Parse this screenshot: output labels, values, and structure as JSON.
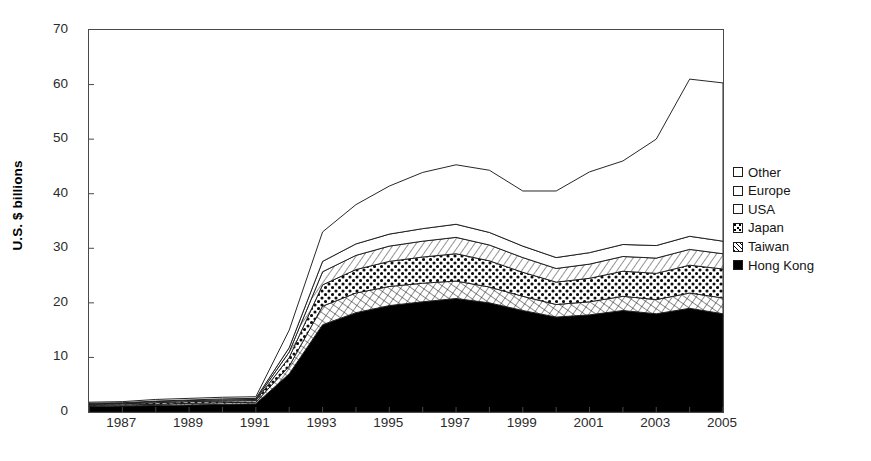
{
  "chart_data": {
    "type": "area",
    "stacked": true,
    "title": "",
    "xlabel": "",
    "ylabel": "U.S. $ billions",
    "ylim": [
      0,
      70
    ],
    "ytick_step": 10,
    "yticks": [
      70,
      60,
      50,
      40,
      30,
      20,
      10,
      0
    ],
    "xlim": [
      1986,
      2005
    ],
    "xticks": [
      1987,
      1989,
      1991,
      1993,
      1995,
      1997,
      1999,
      2001,
      2003,
      2005
    ],
    "x": [
      1986,
      1987,
      1988,
      1989,
      1990,
      1991,
      1992,
      1993,
      1994,
      1995,
      1996,
      1997,
      1998,
      1999,
      2000,
      2001,
      2002,
      2003,
      2004,
      2005
    ],
    "grid": false,
    "legend_position": "right",
    "series": [
      {
        "name": "Hong Kong",
        "fill": "solid-black",
        "values": [
          1.0,
          1.1,
          1.2,
          1.3,
          1.4,
          1.5,
          7.0,
          16.0,
          18.2,
          19.5,
          20.2,
          20.8,
          20.0,
          18.6,
          17.4,
          17.8,
          18.6,
          18.0,
          19.0,
          18.0
        ]
      },
      {
        "name": "Taiwan",
        "fill": "diagonal-crosshatch",
        "values": [
          0.2,
          0.2,
          0.2,
          0.3,
          0.3,
          0.3,
          1.4,
          3.4,
          3.6,
          3.5,
          3.4,
          3.2,
          2.9,
          2.6,
          2.3,
          2.4,
          2.6,
          2.6,
          2.8,
          2.9
        ]
      },
      {
        "name": "Japan",
        "fill": "dotted",
        "values": [
          0.2,
          0.2,
          0.3,
          0.3,
          0.3,
          0.3,
          1.6,
          3.9,
          4.3,
          4.6,
          4.8,
          5.0,
          4.8,
          4.4,
          4.1,
          4.3,
          4.6,
          4.8,
          5.1,
          5.3
        ]
      },
      {
        "name": "USA",
        "fill": "diagonal-lines",
        "values": [
          0.1,
          0.1,
          0.2,
          0.2,
          0.2,
          0.2,
          1.0,
          2.4,
          2.6,
          2.8,
          2.9,
          3.0,
          2.9,
          2.7,
          2.5,
          2.6,
          2.7,
          2.8,
          2.9,
          2.8
        ]
      },
      {
        "name": "Europe",
        "fill": "white",
        "values": [
          0.1,
          0.1,
          0.1,
          0.1,
          0.2,
          0.2,
          0.8,
          1.9,
          2.1,
          2.2,
          2.3,
          2.4,
          2.3,
          2.1,
          2.0,
          2.1,
          2.2,
          2.3,
          2.4,
          2.3
        ]
      },
      {
        "name": "Other",
        "fill": "white",
        "values": [
          0.2,
          0.2,
          0.3,
          0.3,
          0.3,
          0.3,
          3.2,
          5.4,
          7.2,
          8.8,
          10.3,
          10.9,
          11.4,
          10.1,
          12.2,
          14.8,
          15.3,
          19.5,
          28.8,
          29.0
        ]
      }
    ],
    "totals": [
      1.8,
      1.9,
      2.3,
      2.5,
      2.7,
      2.8,
      15.0,
      33.0,
      38.0,
      41.4,
      44.0,
      45.3,
      44.3,
      40.5,
      40.5,
      44.0,
      46.0,
      50.0,
      61.0,
      60.3
    ]
  },
  "legend": {
    "items": [
      {
        "label": "Other",
        "swatch": "white"
      },
      {
        "label": "Europe",
        "swatch": "white"
      },
      {
        "label": "USA",
        "swatch": "white"
      },
      {
        "label": "Japan",
        "swatch": "dotted"
      },
      {
        "label": "Taiwan",
        "swatch": "diagonal-lines"
      },
      {
        "label": "Hong Kong",
        "swatch": "solid-black"
      }
    ]
  },
  "colors": {
    "axis": "#4a4a4a",
    "line": "#1b1b1b",
    "solid": "#000000",
    "background": "#ffffff",
    "tick_text": "#2b2b2b"
  }
}
